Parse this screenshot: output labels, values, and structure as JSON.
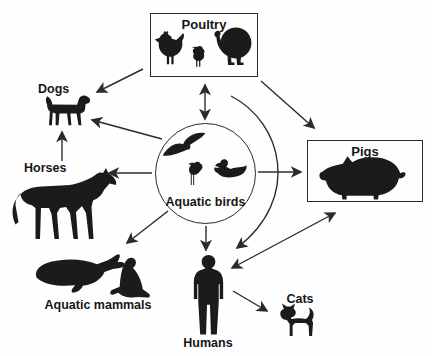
{
  "diagram": {
    "type": "transmission-diagram",
    "colors": {
      "ink": "#1b1b1b",
      "line": "#2b2b2b",
      "background": "#fefefe"
    },
    "nodes": {
      "poultry": {
        "label": "Poultry",
        "shape": "box",
        "icons": [
          "hen-icon",
          "chick-icon",
          "turkey-icon"
        ]
      },
      "aquatic_birds": {
        "label": "Aquatic birds",
        "shape": "circle",
        "icons": [
          "flying-gull-icon",
          "wader-icon",
          "duck-icon"
        ]
      },
      "dogs": {
        "label": "Dogs",
        "shape": "none",
        "icons": [
          "dog-icon"
        ]
      },
      "horses": {
        "label": "Horses",
        "shape": "none",
        "icons": [
          "horse-icon"
        ]
      },
      "pigs": {
        "label": "Pigs",
        "shape": "box",
        "icons": [
          "pig-icon"
        ]
      },
      "aquatic_mammals": {
        "label": "Aquatic mammals",
        "shape": "none",
        "icons": [
          "whale-icon",
          "seal-icon"
        ]
      },
      "humans": {
        "label": "Humans",
        "shape": "none",
        "icons": [
          "human-icon"
        ]
      },
      "cats": {
        "label": "Cats",
        "shape": "none",
        "icons": [
          "cat-icon"
        ]
      }
    },
    "edges": [
      {
        "from": "aquatic_birds",
        "to": "poultry",
        "bidirectional": true,
        "style": "straight"
      },
      {
        "from": "poultry",
        "to": "dogs",
        "bidirectional": false,
        "style": "straight"
      },
      {
        "from": "poultry",
        "to": "pigs",
        "bidirectional": false,
        "style": "straight"
      },
      {
        "from": "poultry",
        "to": "humans",
        "bidirectional": false,
        "style": "curved"
      },
      {
        "from": "aquatic_birds",
        "to": "dogs",
        "bidirectional": false,
        "style": "straight"
      },
      {
        "from": "aquatic_birds",
        "to": "horses",
        "bidirectional": false,
        "style": "straight"
      },
      {
        "from": "aquatic_birds",
        "to": "pigs",
        "bidirectional": false,
        "style": "straight"
      },
      {
        "from": "aquatic_birds",
        "to": "aquatic_mammals",
        "bidirectional": false,
        "style": "straight"
      },
      {
        "from": "aquatic_birds",
        "to": "humans",
        "bidirectional": false,
        "style": "straight"
      },
      {
        "from": "horses",
        "to": "dogs",
        "bidirectional": false,
        "style": "straight"
      },
      {
        "from": "pigs",
        "to": "humans",
        "bidirectional": true,
        "style": "straight"
      },
      {
        "from": "humans",
        "to": "cats",
        "bidirectional": false,
        "style": "straight"
      }
    ]
  }
}
